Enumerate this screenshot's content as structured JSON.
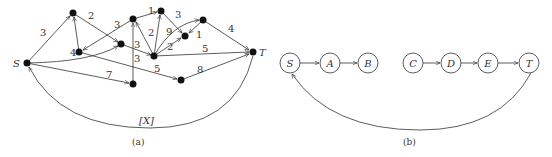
{
  "panel_a": {
    "caption": "(a)",
    "source_label": "S",
    "sink_label": "T",
    "feedback_label": "[X]",
    "nodes": [
      {
        "id": "S",
        "x": 27,
        "y": 63
      },
      {
        "id": "n1",
        "x": 73,
        "y": 13
      },
      {
        "id": "n2",
        "x": 79,
        "y": 52
      },
      {
        "id": "n3",
        "x": 121,
        "y": 44
      },
      {
        "id": "n4",
        "x": 133,
        "y": 19
      },
      {
        "id": "n5",
        "x": 161,
        "y": 11
      },
      {
        "id": "n6",
        "x": 154,
        "y": 56
      },
      {
        "id": "n7",
        "x": 185,
        "y": 36
      },
      {
        "id": "n8",
        "x": 203,
        "y": 20
      },
      {
        "id": "T",
        "x": 253,
        "y": 52
      },
      {
        "id": "n9",
        "x": 133,
        "y": 84
      },
      {
        "id": "n10",
        "x": 181,
        "y": 80
      }
    ],
    "edges": [
      {
        "from": "S",
        "to": "n1",
        "weight": "3"
      },
      {
        "from": "n1",
        "to": "n3",
        "weight": "2"
      },
      {
        "from": "n2",
        "to": "n1",
        "weight": "4"
      },
      {
        "from": "n4",
        "to": "n2",
        "weight": "3"
      },
      {
        "from": "S",
        "to": "n3",
        "weight": ""
      },
      {
        "from": "n3",
        "to": "n6",
        "weight": "3"
      },
      {
        "from": "n9",
        "to": "n4",
        "weight": "3"
      },
      {
        "from": "n4",
        "to": "n5",
        "weight": "1"
      },
      {
        "from": "n5",
        "to": "n7",
        "weight": "3"
      },
      {
        "from": "n6",
        "to": "n4",
        "weight": "2"
      },
      {
        "from": "n6",
        "to": "n5",
        "weight": ""
      },
      {
        "from": "n6",
        "to": "n8",
        "weight": "9"
      },
      {
        "from": "n6",
        "to": "n7",
        "weight": "2"
      },
      {
        "from": "n8",
        "to": "n7",
        "weight": "1"
      },
      {
        "from": "n8",
        "to": "T",
        "weight": "4"
      },
      {
        "from": "n6",
        "to": "T",
        "weight": "5"
      },
      {
        "from": "n2",
        "to": "n10",
        "weight": "5"
      },
      {
        "from": "S",
        "to": "n9",
        "weight": "7"
      },
      {
        "from": "n10",
        "to": "T",
        "weight": "8"
      },
      {
        "from": "T",
        "to": "S",
        "weight": "[X]"
      }
    ]
  },
  "panel_b": {
    "caption": "(b)",
    "nodes": [
      {
        "id": "S",
        "label": "S",
        "x": 290,
        "y": 63
      },
      {
        "id": "A",
        "label": "A",
        "x": 330,
        "y": 63
      },
      {
        "id": "B",
        "label": "B",
        "x": 368,
        "y": 63
      },
      {
        "id": "C",
        "label": "C",
        "x": 413,
        "y": 63
      },
      {
        "id": "D",
        "label": "D",
        "x": 451,
        "y": 63
      },
      {
        "id": "E",
        "label": "E",
        "x": 488,
        "y": 63
      },
      {
        "id": "T",
        "label": "T",
        "x": 529,
        "y": 63
      }
    ],
    "edges": [
      {
        "from": "S",
        "to": "A"
      },
      {
        "from": "A",
        "to": "B"
      },
      {
        "from": "C",
        "to": "D"
      },
      {
        "from": "D",
        "to": "E"
      },
      {
        "from": "E",
        "to": "T"
      },
      {
        "from": "T",
        "to": "S"
      }
    ]
  }
}
